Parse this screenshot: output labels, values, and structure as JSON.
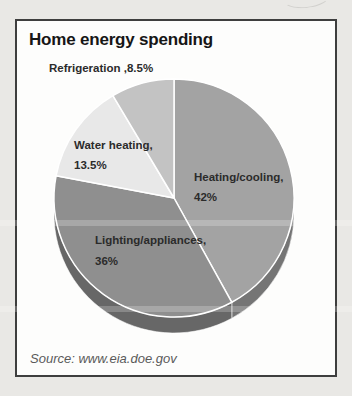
{
  "card": {
    "title": "Home energy spending",
    "source": "Source: www.eia.doe.gov"
  },
  "chart_data": {
    "type": "pie",
    "title": "Home energy spending",
    "categories": [
      "Heating/cooling",
      "Lighting/appliances",
      "Water heating",
      "Refrigeration"
    ],
    "values": [
      42,
      36,
      13.5,
      8.5
    ],
    "unit": "%",
    "start_angle_deg": 0,
    "direction": "clockwise",
    "style": "3d",
    "slice_colors": [
      "#a3a3a3",
      "#8f8f8f",
      "#e8e8e8",
      "#c3c3c3"
    ],
    "separator_color": "#ffffff",
    "legend_position": "labels-on-chart",
    "source": "Source: www.eia.doe.gov",
    "labels": [
      {
        "lines": [
          "Heating/cooling,",
          "42%"
        ]
      },
      {
        "lines": [
          "Lighting/appliances,",
          "36%"
        ]
      },
      {
        "lines": [
          "Water heating,",
          "13.5%"
        ]
      },
      {
        "lines": [
          "Refrigeration ,8.5%"
        ]
      }
    ]
  }
}
